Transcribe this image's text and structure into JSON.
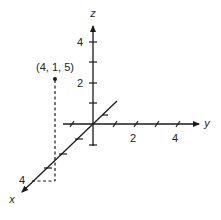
{
  "diagram": {
    "type": "3d-coordinate-axes",
    "colors": {
      "line": "#1a1a1a",
      "text": "#222222",
      "background": "#ffffff"
    },
    "axes": {
      "x": {
        "label": "x",
        "tick_label": "4"
      },
      "y": {
        "label": "y",
        "tick_labels": [
          "2",
          "4"
        ]
      },
      "z": {
        "label": "z",
        "tick_labels": [
          "2",
          "4"
        ]
      }
    },
    "point": {
      "label": "(4, 1, 5)",
      "coords": [
        4,
        1,
        5
      ]
    }
  }
}
